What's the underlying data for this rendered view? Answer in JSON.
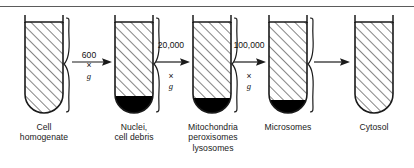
{
  "figure": {
    "background_color": "#ffffff",
    "line_color": "#1a1a1a",
    "pellet_color": "#000000",
    "hatch_color": "#2a2a2a",
    "rule_color": "#5b5b5b"
  },
  "tubes": [
    {
      "id": "tube-1",
      "caption": "Cell\nhomogenate",
      "has_pellet": false,
      "pellet_height": 0,
      "x": 22,
      "width": 38,
      "body_height": 98
    },
    {
      "id": "tube-2",
      "caption": "Nuclei,\ncell debris",
      "has_pellet": true,
      "pellet_height": 17,
      "x": 112,
      "width": 38,
      "body_height": 98
    },
    {
      "id": "tube-3",
      "caption": "Mitochondria\nperoxisomes\nlysosomes",
      "has_pellet": true,
      "pellet_height": 15,
      "x": 190,
      "width": 38,
      "body_height": 98
    },
    {
      "id": "tube-4",
      "caption": "Microsomes",
      "has_pellet": true,
      "pellet_height": 14,
      "x": 266,
      "width": 38,
      "body_height": 98
    },
    {
      "id": "tube-5",
      "caption": "Cytosol",
      "has_pellet": false,
      "pellet_height": 0,
      "x": 352,
      "width": 38,
      "body_height": 98
    }
  ],
  "arrows": [
    {
      "id": "arrow-1",
      "label_line1": "600",
      "label_mult": "×",
      "label_g": "g",
      "label_layout": "single-line",
      "label_text": "600 × g",
      "x": 70,
      "y": 52,
      "width": 38
    },
    {
      "id": "arrow-2",
      "label_line1": "20,000",
      "label_mult": "×",
      "label_g": "g",
      "label_layout": "two-line",
      "label_text": "20,000\n× g",
      "x": 152,
      "y": 58,
      "width": 34
    },
    {
      "id": "arrow-3",
      "label_line1": "100,000",
      "label_mult": "×",
      "label_g": "g",
      "label_layout": "two-line",
      "label_text": "100,000\n× g",
      "x": 230,
      "y": 58,
      "width": 32
    },
    {
      "id": "arrow-4",
      "label_line1": "",
      "label_mult": "",
      "label_g": "",
      "label_layout": "none",
      "label_text": "",
      "x": 312,
      "y": 58,
      "width": 36
    }
  ],
  "braces": [
    {
      "id": "brace-1",
      "x": 62,
      "top": 18,
      "height": 96
    },
    {
      "id": "brace-2",
      "x": 152,
      "top": 18,
      "height": 96
    },
    {
      "id": "brace-3",
      "x": 230,
      "top": 18,
      "height": 96
    },
    {
      "id": "brace-4",
      "x": 306,
      "top": 18,
      "height": 96
    }
  ]
}
